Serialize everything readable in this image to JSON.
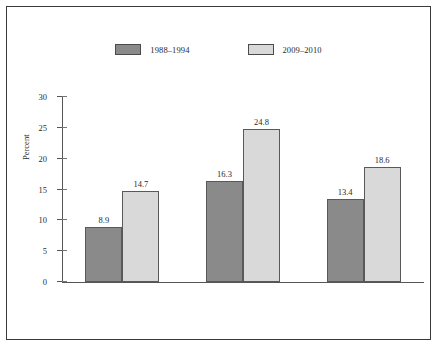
{
  "chart_data": {
    "type": "bar",
    "title": "",
    "xlabel": "",
    "ylabel": "Percent",
    "ylim": [
      0,
      30
    ],
    "yticks": [
      0,
      5,
      10,
      15,
      20,
      25,
      30
    ],
    "ytick_labels": [
      "0",
      "5",
      "10",
      "15",
      "20",
      "25",
      "30"
    ],
    "grid": false,
    "legend_position": "top-center",
    "categories": [
      "Non-Hispanic white",
      "Non-Hispanic black",
      "Mexican American"
    ],
    "series": [
      {
        "name": "1988–1994",
        "color": "#8a8a8a",
        "values": [
          8.9,
          16.3,
          13.4
        ],
        "value_labels": [
          "8.9",
          "16.3",
          "13.4"
        ]
      },
      {
        "name": "2009–2010",
        "color": "#d9d9d9",
        "values": [
          14.7,
          24.8,
          18.6
        ],
        "value_labels": [
          "14.7",
          "24.8",
          "18.6"
        ]
      }
    ]
  },
  "colors": {
    "series_1988_1994": "#8a8a8a",
    "series_2009_2010": "#d9d9d9",
    "bar_outline": "#595959",
    "axis": "#555555",
    "frame": "#3a3a3a",
    "text": "#2b2b2b",
    "background": "#ffffff"
  }
}
